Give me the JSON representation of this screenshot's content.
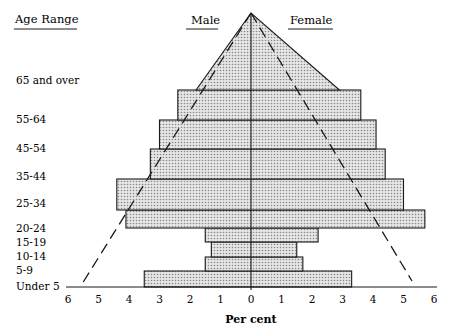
{
  "chart_data": {
    "type": "bar",
    "subtype": "population-pyramid",
    "title": "",
    "headers": {
      "age": "Age Range",
      "male": "Male",
      "female": "Female"
    },
    "xlabel": "Per cent",
    "ylabel": "Age Range",
    "xlim": [
      -6,
      6
    ],
    "x_ticks": [
      "6",
      "5",
      "4",
      "3",
      "2",
      "1",
      "0",
      "1",
      "2",
      "3",
      "4",
      "5",
      "6"
    ],
    "categories": [
      "Under 5",
      "5-9",
      "10-14",
      "15-19",
      "20-24",
      "25-34",
      "35-44",
      "45-54",
      "55-64",
      "65 and over"
    ],
    "series": [
      {
        "name": "Male",
        "side": "left",
        "values": [
          3.5,
          1.5,
          1.3,
          1.5,
          4.1,
          4.4,
          3.3,
          3.0,
          2.4,
          1.8
        ]
      },
      {
        "name": "Female",
        "side": "right",
        "values": [
          3.3,
          1.7,
          1.5,
          2.2,
          5.7,
          5.0,
          4.4,
          4.1,
          3.6,
          2.9
        ]
      }
    ],
    "grid": false,
    "legend": "none"
  },
  "labels": {
    "age_header": "Age Range",
    "male_header": "Male",
    "female_header": "Female",
    "xlabel": "Per cent",
    "ages": [
      "Under 5",
      "5-9",
      "10-14",
      "15-19",
      "20-24",
      "25-34",
      "35-44",
      "45-54",
      "55-64",
      "65 and over"
    ],
    "ticks": [
      "6",
      "5",
      "4",
      "3",
      "2",
      "1",
      "0",
      "1",
      "2",
      "3",
      "4",
      "5",
      "6"
    ]
  },
  "colors": {
    "fill": "#d4d4d4",
    "stroke": "#1a1a1a"
  }
}
